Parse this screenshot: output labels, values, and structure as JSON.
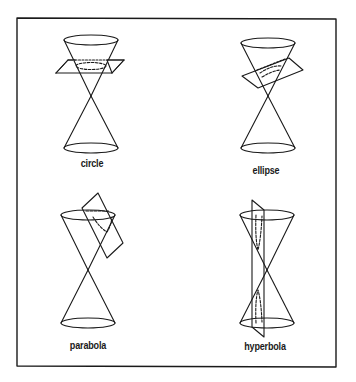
{
  "figure": {
    "frame": {
      "x1": 17,
      "y1": 18,
      "x2": 336,
      "y2": 367
    },
    "stroke_color": "#1a1a1a",
    "panels": [
      {
        "id": "circle",
        "label": "circle",
        "cone": {
          "cx": 91,
          "top_y": 40,
          "apex_y": 96,
          "bottom_y": 148,
          "rx": 27,
          "ry": 5
        },
        "label_pos": {
          "x": 92,
          "y": 157
        }
      },
      {
        "id": "ellipse",
        "label": "ellipse",
        "cone": {
          "cx": 268,
          "top_y": 43,
          "apex_y": 96,
          "bottom_y": 148,
          "rx": 27,
          "ry": 5
        },
        "label_pos": {
          "x": 266,
          "y": 164
        }
      },
      {
        "id": "parabola",
        "label": "parabola",
        "cone": {
          "cx": 88,
          "top_y": 215,
          "apex_y": 270,
          "bottom_y": 323,
          "rx": 27,
          "ry": 5
        },
        "label_pos": {
          "x": 88,
          "y": 339
        }
      },
      {
        "id": "hyperbola",
        "label": "hyperbola",
        "cone": {
          "cx": 267,
          "top_y": 215,
          "apex_y": 270,
          "bottom_y": 323,
          "rx": 27,
          "ry": 5
        },
        "label_pos": {
          "x": 265,
          "y": 340
        }
      }
    ]
  }
}
